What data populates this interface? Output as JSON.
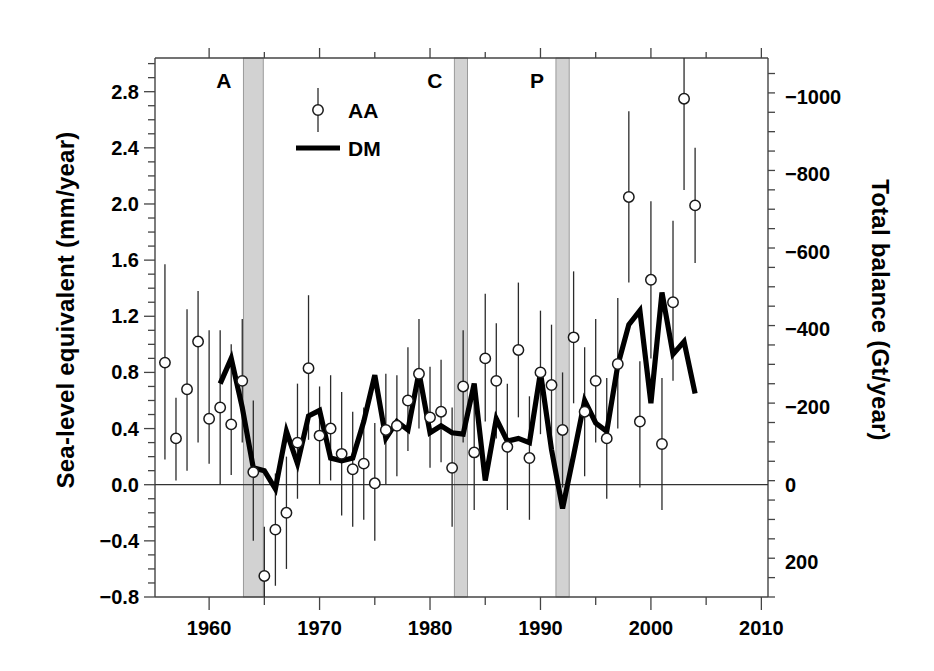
{
  "chart_data": {
    "type": "scatter",
    "title": "",
    "xlabel": "",
    "ylabel": "Sea-level equivalent (mm/year)",
    "ylabel_right": "Total balance (Gt/year)",
    "xlim": [
      1955.1,
      2010.6
    ],
    "ylim": [
      -0.8,
      3.04
    ],
    "ylim_right": [
      290,
      -1100
    ],
    "grid": false,
    "legend_position": "top-left-inside",
    "x_ticks_major": [
      1960,
      1970,
      1980,
      1990,
      2000,
      2010
    ],
    "x_ticks_major_labels": [
      "1960",
      "1970",
      "1980",
      "1990",
      "2000",
      "2010"
    ],
    "x_ticks_minor": [
      1965,
      1975,
      1985,
      1995,
      2005
    ],
    "y_ticks_major": [
      -0.8,
      -0.4,
      0.0,
      0.4,
      0.8,
      1.2,
      1.6,
      2.0,
      2.4,
      2.8
    ],
    "y_ticks_major_labels": [
      "−0.8",
      "−0.4",
      "0.0",
      "0.4",
      "0.8",
      "1.2",
      "1.6",
      "2.0",
      "2.4",
      "2.8"
    ],
    "y_tick_minor_step": 0.1,
    "y_right_ticks_major": [
      200,
      0,
      -200,
      -400,
      -600,
      -800,
      -1000
    ],
    "y_right_ticks_major_labels": [
      "200",
      "0",
      "−200",
      "−400",
      "−600",
      "−800",
      "−1000"
    ],
    "y_right_tick_minor_step": 50,
    "zero_line_value": 0.0,
    "legend": [
      {
        "name": "AA",
        "marker": "open-circle-with-errorbar",
        "color": "#000000"
      },
      {
        "name": "DM",
        "marker": "thick-line",
        "color": "#000000"
      }
    ],
    "eruption_bands": [
      {
        "label": "A",
        "start": 1963.1,
        "end": 1964.9
      },
      {
        "label": "C",
        "start": 1982.2,
        "end": 1983.4
      },
      {
        "label": "P",
        "start": 1991.4,
        "end": 1992.6
      }
    ],
    "band_color": "#d2d2d2",
    "series": [
      {
        "name": "AA",
        "marker": "open-circle",
        "x": [
          1956.0,
          1957.0,
          1958.0,
          1959.0,
          1960.0,
          1961.0,
          1962.0,
          1963.0,
          1964.0,
          1965.0,
          1966.0,
          1967.0,
          1968.0,
          1969.0,
          1970.0,
          1971.0,
          1972.0,
          1973.0,
          1974.0,
          1975.0,
          1976.0,
          1977.0,
          1978.0,
          1979.0,
          1980.0,
          1981.0,
          1982.0,
          1983.0,
          1984.0,
          1985.0,
          1986.0,
          1987.0,
          1988.0,
          1989.0,
          1990.0,
          1991.0,
          1992.0,
          1993.0,
          1994.0,
          1995.0,
          1996.0,
          1997.0,
          1998.0,
          1999.0,
          2000.0,
          2001.0,
          2002.0,
          2003.0,
          2004.0
        ],
        "values": [
          0.87,
          0.33,
          0.68,
          1.02,
          0.47,
          0.55,
          0.43,
          0.74,
          0.09,
          -0.65,
          -0.32,
          -0.2,
          0.3,
          0.83,
          0.35,
          0.4,
          0.22,
          0.11,
          0.15,
          0.01,
          0.39,
          0.42,
          0.6,
          0.79,
          0.48,
          0.52,
          0.12,
          0.7,
          0.23,
          0.9,
          0.74,
          0.27,
          0.96,
          0.19,
          0.8,
          0.71,
          0.39,
          1.05,
          0.52,
          0.74,
          0.33,
          0.86,
          2.05,
          0.45,
          1.46,
          0.29,
          1.3,
          2.75,
          1.99
        ],
        "err_low": [
          0.18,
          0.03,
          0.1,
          0.3,
          0.15,
          0.0,
          0.07,
          0.3,
          -0.4,
          -1.0,
          -0.72,
          -0.6,
          -0.1,
          0.32,
          0.0,
          0.03,
          -0.22,
          -0.3,
          -0.25,
          -0.4,
          0.0,
          0.06,
          0.24,
          0.4,
          0.12,
          0.16,
          -0.3,
          0.3,
          -0.18,
          0.45,
          0.33,
          -0.18,
          0.48,
          -0.25,
          0.36,
          0.28,
          -0.02,
          0.58,
          0.06,
          0.3,
          -0.1,
          0.4,
          1.44,
          -0.02,
          0.9,
          -0.18,
          0.74,
          2.1,
          1.58
        ],
        "err_high": [
          1.57,
          0.62,
          1.25,
          1.38,
          1.1,
          1.1,
          1.0,
          1.18,
          0.6,
          -0.3,
          0.08,
          0.2,
          0.72,
          1.35,
          0.7,
          0.78,
          0.66,
          0.52,
          0.55,
          0.44,
          0.79,
          0.78,
          0.98,
          1.18,
          0.84,
          0.89,
          0.55,
          1.1,
          0.66,
          1.36,
          1.15,
          0.72,
          1.44,
          0.63,
          1.24,
          1.14,
          0.8,
          1.52,
          0.98,
          1.18,
          0.76,
          1.33,
          2.66,
          0.88,
          2.02,
          0.76,
          1.88,
          3.04,
          2.4
        ]
      },
      {
        "name": "DM",
        "marker": "line",
        "x": [
          1961.0,
          1962.0,
          1963.0,
          1964.0,
          1965.0,
          1966.0,
          1967.0,
          1968.0,
          1969.0,
          1970.0,
          1971.0,
          1972.0,
          1973.0,
          1974.0,
          1975.0,
          1976.0,
          1977.0,
          1978.0,
          1979.0,
          1980.0,
          1981.0,
          1982.0,
          1983.0,
          1984.0,
          1985.0,
          1986.0,
          1987.0,
          1988.0,
          1989.0,
          1990.0,
          1991.0,
          1992.0,
          1993.0,
          1994.0,
          1995.0,
          1996.0,
          1997.0,
          1998.0,
          1999.0,
          2000.0,
          2001.0,
          2002.0,
          2003.0,
          2004.0
        ],
        "values": [
          0.72,
          0.9,
          0.55,
          0.12,
          0.1,
          -0.03,
          0.38,
          0.15,
          0.49,
          0.53,
          0.19,
          0.17,
          0.19,
          0.45,
          0.78,
          0.33,
          0.45,
          0.39,
          0.8,
          0.37,
          0.42,
          0.37,
          0.36,
          0.72,
          0.03,
          0.47,
          0.31,
          0.33,
          0.3,
          0.8,
          0.25,
          -0.17,
          0.21,
          0.6,
          0.44,
          0.38,
          0.85,
          1.14,
          1.24,
          0.58,
          1.37,
          0.93,
          1.02,
          0.65
        ]
      }
    ]
  },
  "annotations": {
    "band_labels": [
      "A",
      "C",
      "P"
    ]
  }
}
